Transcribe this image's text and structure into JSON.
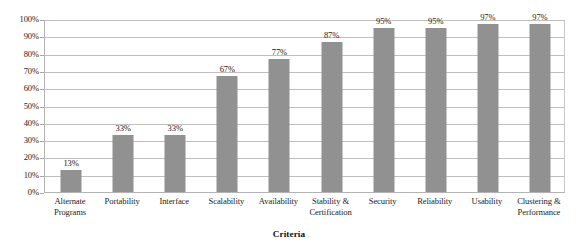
{
  "chart_data": {
    "type": "bar",
    "title": "",
    "xlabel": "Criteria",
    "ylabel": "",
    "categories": [
      "Alternate Programs",
      "Portability",
      "Interface",
      "Scalability",
      "Availability",
      "Stability & Certification",
      "Security",
      "Reliability",
      "Usability",
      "Clustering & Performance"
    ],
    "values": [
      13,
      33,
      33,
      67,
      77,
      87,
      95,
      95,
      97,
      97
    ],
    "value_labels": [
      "13%",
      "33%",
      "33%",
      "67%",
      "77%",
      "87%",
      "95%",
      "95%",
      "97%",
      "97%"
    ],
    "ylim": [
      0,
      100
    ],
    "ytick_values": [
      0,
      10,
      20,
      30,
      40,
      50,
      60,
      70,
      80,
      90,
      100
    ],
    "ytick_labels": [
      "0%",
      "10%",
      "20%",
      "30%",
      "40%",
      "50%",
      "60%",
      "70%",
      "80%",
      "90%",
      "100%"
    ],
    "grid": true,
    "legend": false,
    "legend_position": "none",
    "bar_color": "#919191",
    "gridline_color": "#bfbfbf",
    "plot_border_color": "#b3b3b3",
    "background_color": "#ffffff"
  },
  "category_lines": [
    [
      "Alternate",
      "Programs"
    ],
    [
      "Portability"
    ],
    [
      "Interface"
    ],
    [
      "Scalability"
    ],
    [
      "Availability"
    ],
    [
      "Stability &",
      "Certification"
    ],
    [
      "Security"
    ],
    [
      "Reliability"
    ],
    [
      "Usability"
    ],
    [
      "Clustering &",
      "Performance"
    ]
  ]
}
